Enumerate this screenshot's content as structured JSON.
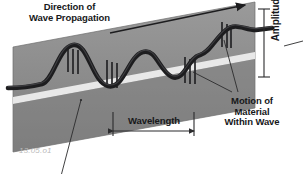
{
  "figure": {
    "id_caption": "13.05.o1",
    "title_concept": "transverse-wave-diagram",
    "background_color": "#ffffff"
  },
  "labels": {
    "direction": "Direction of\nWave Propagation",
    "amplitude": "Amplitude",
    "wavelength": "Wavelength",
    "motion": "Motion of\nMaterial\nWithin Wave"
  },
  "colors": {
    "slab_top": "#8d8d8d",
    "slab_bottom": "#828282",
    "slab_band": "#f2f2f2",
    "slab_edge": "#6f6f6f",
    "wave": "#1d1d1f",
    "text": "#17181a",
    "leader": "#2b2b2d",
    "caption": "#b9b9b9"
  },
  "diagram": {
    "slab": {
      "description": "tilted gray parallelogram medium slab",
      "points": "13,47 255,2 255,108 13,152"
    },
    "band": {
      "description": "light horizontal midline band through slab",
      "points": "13,97 255,52 255,60 13,105"
    },
    "wave": {
      "description": "thick transverse sinusoid along slab",
      "amplitude_px": 34,
      "wavelength_px": 83,
      "cycles": 2.6,
      "stroke_width": 4.6
    },
    "propagation_arrow": {
      "from_x": 110,
      "from_y": 33,
      "to_x": 247,
      "to_y": 4
    },
    "wavelength_measure": {
      "from_x": 113,
      "to_x": 194,
      "y": 131,
      "cap_height": 9
    },
    "amplitude_measure": {
      "x": 264,
      "from_y": 9,
      "to_y": 77,
      "cap_width": 11
    },
    "motion_ticks": [
      {
        "x": 68,
        "y": 46,
        "h": 26
      },
      {
        "x": 73,
        "y": 49,
        "h": 25
      },
      {
        "x": 78,
        "y": 50,
        "h": 24
      },
      {
        "x": 107,
        "y": 60,
        "h": 26
      },
      {
        "x": 112,
        "y": 62,
        "h": 26
      },
      {
        "x": 117,
        "y": 63,
        "h": 25
      },
      {
        "x": 185,
        "y": 57,
        "h": 26
      },
      {
        "x": 190,
        "y": 59,
        "h": 25
      },
      {
        "x": 195,
        "y": 60,
        "h": 24
      },
      {
        "x": 222,
        "y": 22,
        "h": 25
      },
      {
        "x": 227,
        "y": 24,
        "h": 24
      },
      {
        "x": 231,
        "y": 25,
        "h": 23
      }
    ],
    "leader_lines": [
      {
        "name": "motion-leader-upper",
        "x1": 236,
        "y1": 93,
        "x2": 223,
        "y2": 40
      },
      {
        "name": "motion-leader-lower",
        "x1": 232,
        "y1": 93,
        "x2": 193,
        "y2": 73
      },
      {
        "name": "amplitude-leader",
        "x1": 302,
        "y1": 40,
        "x2": 283,
        "y2": 46
      },
      {
        "name": "medium-leader",
        "x1": 62,
        "y1": 174,
        "x2": 81,
        "y2": 101
      }
    ]
  }
}
